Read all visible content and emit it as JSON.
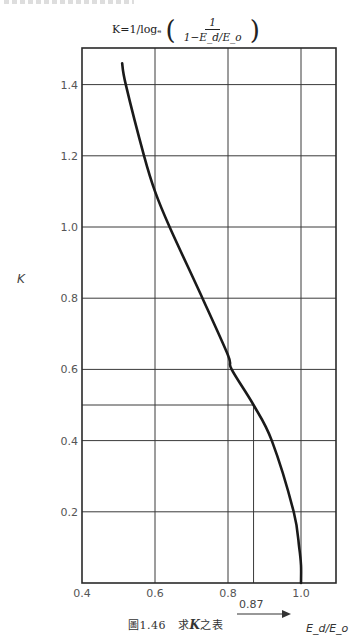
{
  "header": {
    "formula_lhs": "K=1/logₑ",
    "formula_numerator": "1",
    "formula_denominator": "1−E_d/E_o",
    "paren_open": "(",
    "paren_close": ")"
  },
  "caption": {
    "figure_number": "圖1.46",
    "text_prefix": "求",
    "text_var": "K",
    "text_suffix": "之表"
  },
  "axis": {
    "ylabel": "K",
    "xlabel": "E_d/E_o",
    "ref_label": "0.87"
  },
  "colors": {
    "curve": "#1a1a1a",
    "grid": "#3a3a3a",
    "frame": "#2a2a2a",
    "tick_text": "#555555"
  },
  "chart_data": {
    "type": "line",
    "caption": "圖1.46 求K之表",
    "xlabel": "E_d/E_o",
    "ylabel": "K",
    "xlim": [
      0.4,
      1.1
    ],
    "ylim": [
      0,
      1.5
    ],
    "grid": true,
    "x_ticks": [
      0.4,
      0.6,
      0.8,
      1.0
    ],
    "x_tick_labels": [
      "0.4",
      "0.6",
      "0.8",
      "1.0"
    ],
    "y_ticks": [
      0.2,
      0.4,
      0.6,
      0.8,
      1.0,
      1.2,
      1.4
    ],
    "y_tick_labels": [
      "0.2",
      "0.4",
      "0.6",
      "0.8",
      "1.0",
      "1.2",
      "1.4"
    ],
    "annotations": [
      {
        "type": "reference_line",
        "x": 0.87,
        "y": 0.5,
        "label": "0.87",
        "note": "vertical line at x=0.87 from K=0 to K=0.5; horizontal line at K=0.5 from x=0.4 to x=0.87"
      }
    ],
    "series": [
      {
        "name": "K",
        "x": [
          0.51,
          0.52,
          0.57,
          0.6,
          0.64,
          0.73,
          0.8,
          0.81,
          0.87,
          0.92,
          0.98,
          0.995,
          1.0,
          1.0
        ],
        "y": [
          1.46,
          1.4,
          1.2,
          1.1,
          1.0,
          0.8,
          0.64,
          0.6,
          0.5,
          0.4,
          0.2,
          0.1,
          0.05,
          0.0
        ]
      }
    ]
  }
}
